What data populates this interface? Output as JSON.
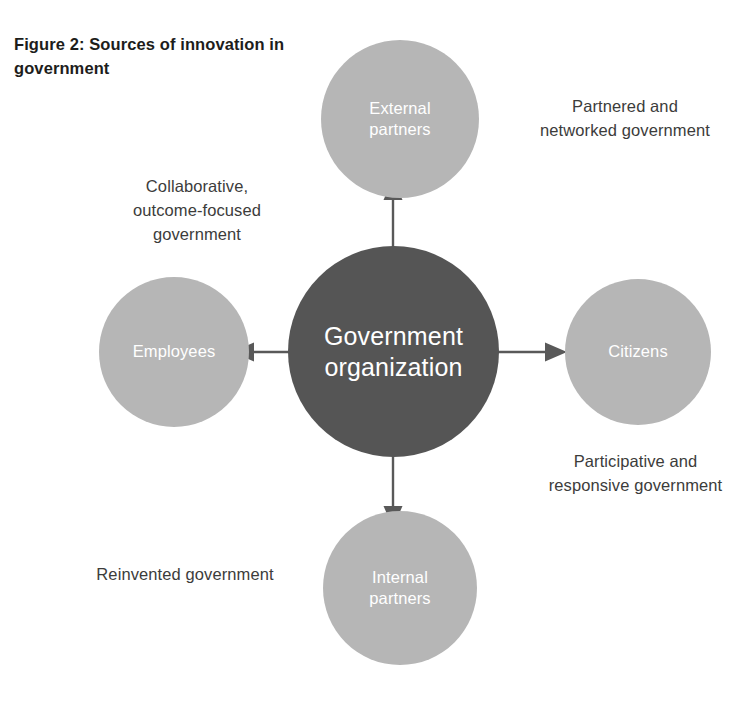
{
  "figure": {
    "title": "Figure 2: Sources of\ninnovation in government",
    "title_line_1": "Figure 2: Sources of",
    "title_line_2": "innovation in government"
  },
  "colors": {
    "center_node_fill": "#555555",
    "satellite_node_fill": "#b6b6b6",
    "node_label_text": "#ffffff",
    "annotation_text": "#3c3c3b",
    "title_text": "#1d1d1b",
    "arrow": "#595959",
    "background": "#ffffff"
  },
  "diagram": {
    "center": {
      "id": "government-organization",
      "label": "Government\norganization"
    },
    "satellites": [
      {
        "id": "external-partners",
        "label": "External\npartners",
        "position": "top",
        "arrow_direction": "outward-up"
      },
      {
        "id": "citizens",
        "label": "Citizens",
        "position": "right",
        "arrow_direction": "outward-right"
      },
      {
        "id": "internal-partners",
        "label": "Internal\npartners",
        "position": "bottom",
        "arrow_direction": "outward-down"
      },
      {
        "id": "employees",
        "label": "Employees",
        "position": "left",
        "arrow_direction": "outward-left"
      }
    ],
    "annotations": [
      {
        "id": "partnered-networked",
        "label": "Partnered and\nnetworked government",
        "relates_to": "external-partners",
        "position": "top-right"
      },
      {
        "id": "collaborative-outcome-focused",
        "label": "Collaborative,\noutcome-focused\ngovernment",
        "relates_to": "employees",
        "position": "top-left"
      },
      {
        "id": "participative-responsive",
        "label": "Participative and\nresponsive government",
        "relates_to": "citizens",
        "position": "bottom-right"
      },
      {
        "id": "reinvented-government",
        "label": "Reinvented government",
        "relates_to": "internal-partners",
        "position": "bottom-left"
      }
    ]
  }
}
